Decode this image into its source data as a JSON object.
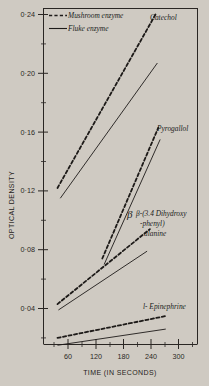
{
  "chart_data": {
    "type": "line",
    "title": "",
    "xlabel": "TIME (IN SECONDS)",
    "ylabel": "OPTICAL DENSITY",
    "xlim": [
      0,
      330
    ],
    "ylim": [
      0.005,
      0.25
    ],
    "grid": false,
    "legend_position": "top-left",
    "xticks": [
      60,
      120,
      180,
      240,
      300
    ],
    "xtick_labels": [
      "60",
      "120",
      "180",
      "240",
      "300"
    ],
    "yticks": [
      0.04,
      0.08,
      0.12,
      0.16,
      0.2,
      0.24
    ],
    "ytick_labels": [
      "0·04",
      "0·08",
      "0·12",
      "0·16",
      "0·20",
      "0·24"
    ],
    "legend": [
      {
        "label": "Mushroom enzyme",
        "style": "dashed"
      },
      {
        "label": "Fluke enzyme",
        "style": "solid"
      }
    ],
    "annotations": [
      {
        "text": "Catechol",
        "x": 248,
        "y": 0.238
      },
      {
        "text": "Pyrogallol",
        "x": 258,
        "y": 0.155
      },
      {
        "text": "β-(3.4 Dihydroxy",
        "x": 245,
        "y": 0.098
      },
      {
        "text": "-phenyl)",
        "x": 255,
        "y": 0.088
      },
      {
        "text": "alanine",
        "x": 262,
        "y": 0.079
      },
      {
        "text": "l- Epinephrine",
        "x": 255,
        "y": 0.031
      }
    ],
    "series": [
      {
        "name": "Catechol — Mushroom enzyme",
        "substrate": "Catechol",
        "enzyme": "Mushroom enzyme",
        "style": "dashed",
        "x": [
          30,
          240
        ],
        "y": [
          0.122,
          0.24
        ]
      },
      {
        "name": "Catechol — Fluke enzyme",
        "substrate": "Catechol",
        "enzyme": "Fluke enzyme",
        "style": "solid",
        "x": [
          36,
          244
        ],
        "y": [
          0.115,
          0.207
        ]
      },
      {
        "name": "Pyrogallol — Mushroom enzyme",
        "substrate": "Pyrogallol",
        "enzyme": "Mushroom enzyme",
        "style": "dashed",
        "x": [
          126,
          246
        ],
        "y": [
          0.074,
          0.163
        ]
      },
      {
        "name": "Pyrogallol — Fluke enzyme",
        "substrate": "Pyrogallol",
        "enzyme": "Fluke enzyme",
        "style": "solid",
        "x": [
          130,
          250
        ],
        "y": [
          0.07,
          0.155
        ]
      },
      {
        "name": "β-(3.4 Dihydroxyphenyl) alanine — Mushroom enzyme",
        "substrate": "β-(3.4 Dihydroxy-phenyl) alanine",
        "enzyme": "Mushroom enzyme",
        "style": "dashed",
        "x": [
          30,
          228
        ],
        "y": [
          0.043,
          0.094
        ]
      },
      {
        "name": "β-(3.4 Dihydroxyphenyl) alanine — Fluke enzyme",
        "substrate": "β-(3.4 Dihydroxy-phenyl) alanine",
        "enzyme": "Fluke enzyme",
        "style": "solid",
        "x": [
          32,
          222
        ],
        "y": [
          0.039,
          0.079
        ]
      },
      {
        "name": "l-Epinephrine — Mushroom enzyme",
        "substrate": "l-Epinephrine",
        "enzyme": "Mushroom enzyme",
        "style": "dashed",
        "x": [
          30,
          264
        ],
        "y": [
          0.02,
          0.035
        ]
      },
      {
        "name": "l-Epinephrine — Fluke enzyme",
        "substrate": "l-Epinephrine",
        "enzyme": "Fluke enzyme",
        "style": "solid",
        "x": [
          30,
          262
        ],
        "y": [
          0.015,
          0.026
        ]
      }
    ]
  }
}
